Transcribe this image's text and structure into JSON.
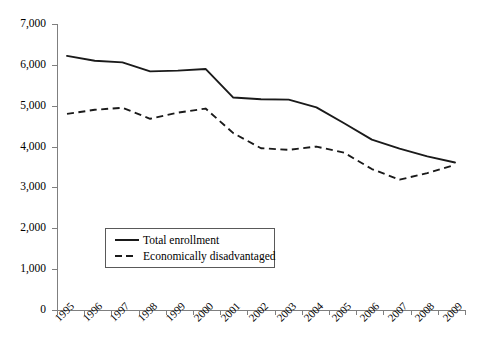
{
  "chart_data": {
    "type": "line",
    "title": "",
    "subtitle": "",
    "xlabel": "",
    "ylabel": "",
    "categories": [
      "1995",
      "1996",
      "1997",
      "1998",
      "1999",
      "2000",
      "2001",
      "2002",
      "2003",
      "2004",
      "2005",
      "2006",
      "2007",
      "2008",
      "2009"
    ],
    "ylim": [
      0,
      7000
    ],
    "ytick_step": 1000,
    "yticks": [
      0,
      1000,
      2000,
      3000,
      4000,
      5000,
      6000,
      7000
    ],
    "ytick_labels": [
      "0",
      "1,000",
      "2,000",
      "3,000",
      "4,000",
      "5,000",
      "6,000",
      "7,000"
    ],
    "grid": false,
    "legend_position": "inside-lower-left",
    "series": [
      {
        "name": "Total enrollment",
        "style": "solid",
        "color": "#1a1a1a",
        "values": [
          6220,
          6100,
          6060,
          5840,
          5860,
          5900,
          5200,
          5160,
          5150,
          4960,
          4570,
          4170,
          3950,
          3760,
          3610
        ]
      },
      {
        "name": "Economically disadvantaged",
        "style": "dashed",
        "color": "#1a1a1a",
        "values": [
          4800,
          4900,
          4950,
          4680,
          4830,
          4930,
          4330,
          3960,
          3920,
          4000,
          3850,
          3450,
          3190,
          3350,
          3550
        ]
      }
    ]
  },
  "axes": {
    "y_labels": [
      "7,000",
      "6,000",
      "5,000",
      "4,000",
      "3,000",
      "2,000",
      "1,000",
      "0"
    ],
    "x_labels": [
      "1995",
      "1996",
      "1997",
      "1998",
      "1999",
      "2000",
      "2001",
      "2002",
      "2003",
      "2004",
      "2005",
      "2006",
      "2007",
      "2008",
      "2009"
    ]
  },
  "legend": {
    "items": [
      {
        "label": "Total enrollment",
        "style": "solid"
      },
      {
        "label": "Economically disadvantaged",
        "style": "dashed"
      }
    ]
  }
}
